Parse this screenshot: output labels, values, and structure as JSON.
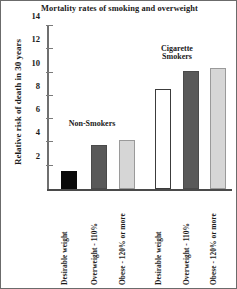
{
  "chart_data": {
    "type": "bar",
    "title": "Mortality rates of smoking and overweight",
    "xlabel": "",
    "ylabel": "Relative risk of death in 30 years",
    "ylim": [
      0,
      14
    ],
    "yticks": [
      2,
      4,
      6,
      8,
      10,
      12,
      14
    ],
    "grid": false,
    "legend": "none",
    "categories": [
      "Desirable weight",
      "Overweight - 110%",
      "Obese - 120% or more",
      "Desirable weight",
      "Overweight - 110%",
      "Obese - 120% or more"
    ],
    "values": [
      1.55,
      3.8,
      4.2,
      8.6,
      10.1,
      10.4
    ],
    "bar_fills": [
      "black",
      "dark",
      "light",
      "white",
      "dark",
      "light"
    ],
    "groups": [
      {
        "name": "Non-Smokers",
        "label": "Non-Smokers",
        "categories": [
          "Desirable weight",
          "Overweight - 110%",
          "Obese - 120% or more"
        ],
        "values": [
          1.55,
          3.8,
          4.2
        ]
      },
      {
        "name": "Cigarette Smokers",
        "label": "Cigarette\nSmokers",
        "categories": [
          "Desirable weight",
          "Overweight - 110%",
          "Obese - 120% or more"
        ],
        "values": [
          8.6,
          10.1,
          10.4
        ]
      }
    ],
    "colors": {
      "black": "#0a0a0a",
      "dark_gray": "#595959",
      "light_gray": "#d6d6d6",
      "white": "#ffffff",
      "axis": "#6f6f6f",
      "border": "#6b6b6b",
      "text": "#1a1a1a"
    }
  }
}
